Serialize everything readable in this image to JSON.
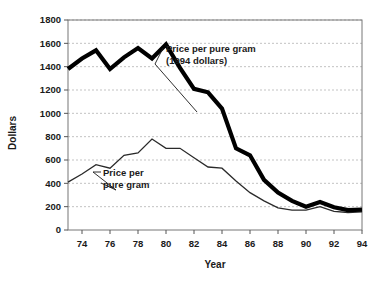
{
  "chart_data": {
    "type": "line",
    "title": "",
    "xlabel": "Year",
    "ylabel": "Dollars",
    "xlim": [
      73,
      94
    ],
    "ylim": [
      0,
      1800
    ],
    "grid": true,
    "legend": "annotations",
    "x": [
      73,
      74,
      75,
      76,
      77,
      78,
      79,
      80,
      81,
      82,
      83,
      84,
      85,
      86,
      87,
      88,
      89,
      90,
      91,
      92,
      93,
      94
    ],
    "xtick_labels": [
      "74",
      "76",
      "78",
      "80",
      "82",
      "84",
      "86",
      "88",
      "90",
      "92",
      "94"
    ],
    "xticks": [
      74,
      76,
      78,
      80,
      82,
      84,
      86,
      88,
      90,
      92,
      94
    ],
    "ytick_labels": [
      "0",
      "200",
      "400",
      "600",
      "800",
      "1000",
      "1200",
      "1400",
      "1600",
      "1800"
    ],
    "yticks": [
      0,
      200,
      400,
      600,
      800,
      1000,
      1200,
      1400,
      1600,
      1800
    ],
    "series": [
      {
        "name": "Price per pure gram (1994 dollars)",
        "style": "thick",
        "values": [
          1380,
          1470,
          1540,
          1380,
          1480,
          1560,
          1470,
          1590,
          1390,
          1210,
          1180,
          1040,
          700,
          640,
          430,
          320,
          250,
          200,
          240,
          195,
          170,
          175
        ]
      },
      {
        "name": "Price per pure gram",
        "style": "thin",
        "values": [
          410,
          480,
          560,
          530,
          640,
          660,
          780,
          700,
          700,
          620,
          540,
          530,
          420,
          320,
          250,
          190,
          170,
          170,
          200,
          160,
          150,
          155
        ]
      }
    ],
    "annotations": [
      {
        "id": "annotation-real",
        "line1": "Price per pure gram",
        "line2": "(1994 dollars)"
      },
      {
        "id": "annotation-nominal",
        "line1": "Price per",
        "line2": "pure gram"
      }
    ],
    "colors": {
      "series_real": "#000000",
      "series_nominal": "#2a2a2a",
      "grid": "#9a9a9a",
      "axis": "#555555",
      "background": "#ffffff"
    }
  }
}
